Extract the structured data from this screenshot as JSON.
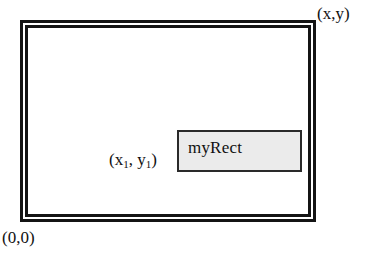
{
  "diagram": {
    "canvas": {
      "width": 370,
      "height": 255,
      "background": "#ffffff"
    },
    "outer_frame": {
      "name": "coordinate-frame",
      "style": "double-rule",
      "border_color": "#141414",
      "gap_color": "#ffffff",
      "fill": "#ffffff"
    },
    "inner_shape": {
      "label": "myRect",
      "fill": "#ebebeb",
      "border_color": "#2a2a2a"
    },
    "labels": {
      "top_right": "(x,y)",
      "bottom_left": "(0,0)",
      "inner_origin_open": "(x",
      "inner_origin_sub1": "1",
      "inner_origin_mid": ", y",
      "inner_origin_sub2": "1",
      "inner_origin_close": ")"
    }
  }
}
